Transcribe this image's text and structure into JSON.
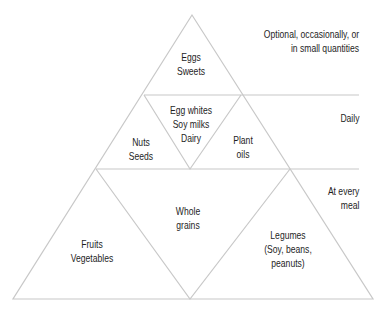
{
  "diagram": {
    "type": "food-pyramid",
    "line_color": "#c8c8c8",
    "text_color": "#1e1e1e",
    "tiers": [
      {
        "id": "top",
        "frequency": [
          "Optional, occasionally, or",
          "in small quantities"
        ],
        "groups": [
          {
            "id": "eggs-sweets",
            "lines": [
              "Eggs",
              "Sweets"
            ]
          }
        ]
      },
      {
        "id": "middle",
        "frequency": [
          "Daily"
        ],
        "groups": [
          {
            "id": "nuts-seeds",
            "lines": [
              "Nuts",
              "Seeds"
            ]
          },
          {
            "id": "egg-whites-soy-dairy",
            "lines": [
              "Egg whites",
              "Soy milks",
              "Dairy"
            ]
          },
          {
            "id": "plant-oils",
            "lines": [
              "Plant",
              "oils"
            ]
          }
        ]
      },
      {
        "id": "bottom",
        "frequency": [
          "At every",
          "meal"
        ],
        "groups": [
          {
            "id": "fruits-vegetables",
            "lines": [
              "Fruits",
              "Vegetables"
            ]
          },
          {
            "id": "whole-grains",
            "lines": [
              "Whole",
              "grains"
            ]
          },
          {
            "id": "legumes",
            "lines": [
              "Legumes",
              "(Soy, beans,",
              "peanuts)"
            ]
          }
        ]
      }
    ]
  }
}
